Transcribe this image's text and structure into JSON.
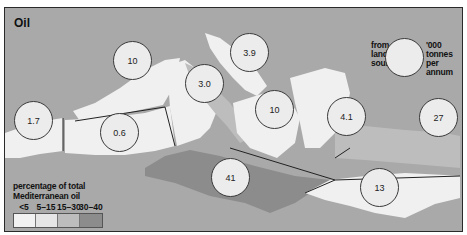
{
  "map": {
    "title": "Oil",
    "key": {
      "left_label": [
        "from all",
        "land based",
        "sources"
      ],
      "right_label": [
        "'000 tonnes",
        "per",
        "annum"
      ]
    },
    "legend": {
      "title_line1": "percentage of total",
      "title_line2": "Mediterranean oil",
      "classes": [
        {
          "label": "<5",
          "color": "#f2f2f2"
        },
        {
          "label": "5–15",
          "color": "#e6e6e6"
        },
        {
          "label": "15–30",
          "color": "#bdbdbd"
        },
        {
          "label": "30–40",
          "color": "#8c8c8c"
        }
      ]
    },
    "regions": [
      {
        "name": "Spain",
        "value": "1.7",
        "class": "<5"
      },
      {
        "name": "France",
        "value": "10",
        "class": "5-15"
      },
      {
        "name": "Algeria/Tunisia west",
        "value": "0.6",
        "class": "<5"
      },
      {
        "name": "Italy west",
        "value": "3.0",
        "class": "<5"
      },
      {
        "name": "Adriatic",
        "value": "3.9",
        "class": "<5"
      },
      {
        "name": "Italy south / Ionian",
        "value": "10",
        "class": "5-15"
      },
      {
        "name": "Aegean",
        "value": "4.1",
        "class": "<5"
      },
      {
        "name": "Levant",
        "value": "27",
        "class": "15-30"
      },
      {
        "name": "Libya/Tunisia",
        "value": "41",
        "class": "30-40"
      },
      {
        "name": "Egypt/Libya east",
        "value": "13",
        "class": "5-15"
      }
    ],
    "colors": {
      "sea": "#a9a9a9",
      "land_light": "#f0f0f0",
      "land_mid": "#bdbdbd",
      "land_dark": "#8c8c8c",
      "circle_fill": "#ececec"
    }
  }
}
